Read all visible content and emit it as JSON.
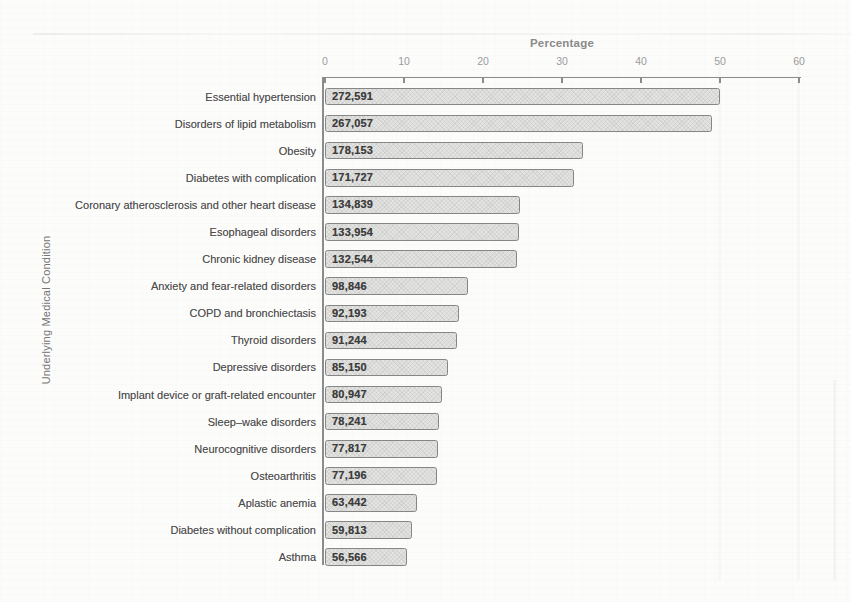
{
  "chart_data": {
    "type": "bar",
    "orientation": "horizontal",
    "title": "",
    "xlabel": "Percentage",
    "ylabel": "Underlying Medical Condition",
    "xlim": [
      0,
      60
    ],
    "x_ticks": [
      0,
      10,
      20,
      30,
      40,
      50,
      60
    ],
    "grid": false,
    "legend": false,
    "categories": [
      "Essential hypertension",
      "Disorders of lipid metabolism",
      "Obesity",
      "Diabetes with complication",
      "Coronary atherosclerosis and other heart disease",
      "Esophageal disorders",
      "Chronic kidney disease",
      "Anxiety and fear-related disorders",
      "COPD and bronchiectasis",
      "Thyroid disorders",
      "Depressive disorders",
      "Implant device or graft-related encounter",
      "Sleep–wake disorders",
      "Neurocognitive disorders",
      "Osteoarthritis",
      "Aplastic anemia",
      "Diabetes without complication",
      "Asthma"
    ],
    "count_labels": [
      "272,591",
      "267,057",
      "178,153",
      "171,727",
      "134,839",
      "133,954",
      "132,544",
      "98,846",
      "92,193",
      "91,244",
      "85,150",
      "80,947",
      "78,241",
      "77,817",
      "77,196",
      "63,442",
      "59,813",
      "56,566"
    ],
    "values": [
      50.0,
      49.0,
      32.7,
      31.5,
      24.7,
      24.6,
      24.3,
      18.1,
      16.9,
      16.7,
      15.6,
      14.8,
      14.4,
      14.3,
      14.2,
      11.6,
      11.0,
      10.4
    ],
    "colors": {
      "background": "#fcfcfb",
      "bar_fill": "#e3e3e1",
      "bar_border": "#868686",
      "axis": "#8c8c8c",
      "tick_label": "#9b9b9b",
      "axis_title": "#8a8a8a",
      "axis_title_y": "#757575",
      "category_label": "#4d4d4d",
      "value_label": "#3d3d3d"
    }
  }
}
